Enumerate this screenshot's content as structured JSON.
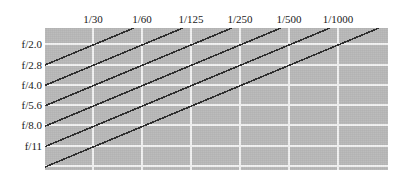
{
  "chart_data": {
    "type": "line",
    "title": "",
    "subtitle": "",
    "xlabel": "",
    "ylabel": "",
    "grid": true,
    "legend_position": "none",
    "x_axis_position": "top",
    "y_axis_position": "left",
    "categories": [
      "1/30",
      "1/60",
      "1/125",
      "1/250",
      "1/500",
      "1/1000"
    ],
    "tick_labels_x": [
      "1/30",
      "1/60",
      "1/125",
      "1/250",
      "1/500",
      "1/1000"
    ],
    "tick_labels_y": [
      "f/2.0",
      "f/2.8",
      "f/4.0",
      "f/5.6",
      "f/8.0",
      "f/11"
    ],
    "annotation": "Equivalent-exposure grid: each diagonal line connects shutter speed / aperture pairs that give the same exposure.",
    "series": [
      {
        "name": "equal-exposure-line-1",
        "x": [
          "1/30",
          "1/60",
          "1/125",
          "1/250",
          "1/500",
          "1/1000"
        ],
        "values": [
          "f/2.8",
          "f/2.0",
          "",
          "",
          "",
          ""
        ]
      },
      {
        "name": "equal-exposure-line-2",
        "x": [
          "1/30",
          "1/60",
          "1/125",
          "1/250",
          "1/500",
          "1/1000"
        ],
        "values": [
          "f/4.0",
          "f/2.8",
          "f/2.0",
          "",
          "",
          ""
        ]
      },
      {
        "name": "equal-exposure-line-3",
        "x": [
          "1/30",
          "1/60",
          "1/125",
          "1/250",
          "1/500",
          "1/1000"
        ],
        "values": [
          "f/5.6",
          "f/4.0",
          "f/2.8",
          "f/2.0",
          "",
          ""
        ]
      },
      {
        "name": "equal-exposure-line-4",
        "x": [
          "1/30",
          "1/60",
          "1/125",
          "1/250",
          "1/500",
          "1/1000"
        ],
        "values": [
          "f/8.0",
          "f/5.6",
          "f/4.0",
          "f/2.8",
          "f/2.0",
          ""
        ]
      },
      {
        "name": "equal-exposure-line-5",
        "x": [
          "1/30",
          "1/60",
          "1/125",
          "1/250",
          "1/500",
          "1/1000"
        ],
        "values": [
          "f/11",
          "f/8.0",
          "f/5.6",
          "f/4.0",
          "f/2.8",
          "f/2.0"
        ]
      },
      {
        "name": "equal-exposure-line-6",
        "x": [
          "1/30",
          "1/60",
          "1/125",
          "1/250",
          "1/500",
          "1/1000"
        ],
        "values": [
          "",
          "f/11",
          "f/8.0",
          "f/5.6",
          "f/4.0",
          "f/2.8"
        ]
      }
    ],
    "colors": {
      "panel_background": "#b9b9b9",
      "gridline": "#f2f2f2",
      "line": "#2b2b2b",
      "text": "#1a1a1a",
      "page_background": "#ffffff"
    }
  },
  "columns": [
    {
      "label": "1/30",
      "x": 93
    },
    {
      "label": "1/60",
      "x": 142
    },
    {
      "label": "1/125",
      "x": 191
    },
    {
      "label": "1/250",
      "x": 240
    },
    {
      "label": "1/500",
      "x": 289
    },
    {
      "label": "1/1000",
      "x": 338
    }
  ],
  "rows": [
    {
      "label": "f/2.0",
      "y": 44
    },
    {
      "label": "f/2.8",
      "y": 65
    },
    {
      "label": "f/4.0",
      "y": 85
    },
    {
      "label": "f/5.6",
      "y": 105
    },
    {
      "label": "f/8.0",
      "y": 125
    },
    {
      "label": "f/11",
      "y": 146
    }
  ]
}
